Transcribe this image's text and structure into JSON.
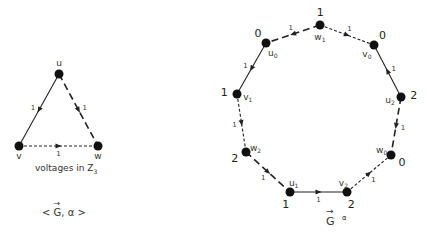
{
  "left_graph": {
    "caption": "voltages in Z",
    "caption_sub": "3",
    "title": "< G, α >",
    "title_parts": {
      "open": "<",
      "G": "G",
      "sep": ", α",
      "close": ">"
    },
    "nodes": [
      {
        "id": "u",
        "label": "u",
        "x": 59,
        "y": 74
      },
      {
        "id": "v",
        "label": "v",
        "x": 19,
        "y": 146
      },
      {
        "id": "w",
        "label": "w",
        "x": 98,
        "y": 146
      }
    ],
    "edges": [
      {
        "from": "u",
        "to": "v",
        "style": "solid",
        "voltage": "1"
      },
      {
        "from": "u",
        "to": "w",
        "style": "long-dash",
        "voltage": "1"
      },
      {
        "from": "v",
        "to": "w",
        "style": "short-dash",
        "voltage": "1"
      }
    ]
  },
  "right_graph": {
    "title": "G",
    "title_sup": "α",
    "nodes": [
      {
        "id": "w1",
        "name": "w",
        "sub": "1",
        "value": "1",
        "x": 320,
        "y": 25
      },
      {
        "id": "v0",
        "name": "v",
        "sub": "0",
        "value": "0",
        "x": 374,
        "y": 45
      },
      {
        "id": "u2",
        "name": "u",
        "sub": "2",
        "value": "2",
        "x": 401,
        "y": 97
      },
      {
        "id": "w0",
        "name": "w",
        "sub": "0",
        "value": "0",
        "x": 391,
        "y": 155
      },
      {
        "id": "v2",
        "name": "v",
        "sub": "2",
        "value": "2",
        "x": 347,
        "y": 192
      },
      {
        "id": "u1",
        "name": "u",
        "sub": "1",
        "value": "1",
        "x": 290,
        "y": 192
      },
      {
        "id": "w2",
        "name": "w",
        "sub": "2",
        "value": "2",
        "x": 246,
        "y": 152
      },
      {
        "id": "v1",
        "name": "v",
        "sub": "1",
        "value": "1",
        "x": 237,
        "y": 94
      },
      {
        "id": "u0",
        "name": "u",
        "sub": "0",
        "value": "0",
        "x": 266,
        "y": 43
      }
    ],
    "edges": [
      {
        "from": "w1",
        "to": "v0",
        "style": "short-dash",
        "voltage": "1"
      },
      {
        "from": "u2",
        "to": "v0",
        "style": "solid",
        "voltage": "1"
      },
      {
        "from": "u2",
        "to": "w0",
        "style": "long-dash",
        "voltage": "1"
      },
      {
        "from": "v2",
        "to": "w0",
        "style": "short-dash",
        "voltage": "1"
      },
      {
        "from": "u1",
        "to": "v2",
        "style": "solid",
        "voltage": "1"
      },
      {
        "from": "w2",
        "to": "u1",
        "style": "long-dash",
        "voltage": "1"
      },
      {
        "from": "v1",
        "to": "w2",
        "style": "short-dash",
        "voltage": "1"
      },
      {
        "from": "u0",
        "to": "v1",
        "style": "solid",
        "voltage": "1"
      },
      {
        "from": "w1",
        "to": "u0",
        "style": "long-dash",
        "voltage": "1"
      }
    ]
  }
}
